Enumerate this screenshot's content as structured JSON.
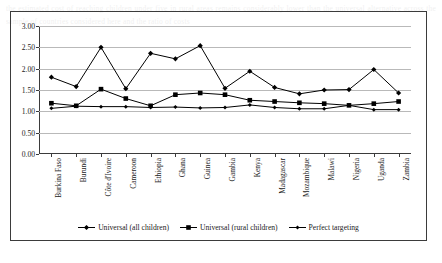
{
  "chart_data": {
    "type": "line",
    "title": "",
    "xlabel": "",
    "ylabel": "",
    "ylim": [
      0,
      3
    ],
    "ytick_step": 0.5,
    "grid": true,
    "legend_position": "bottom",
    "categories": [
      "Burkina Faso",
      "Burundi",
      "Côte d'Ivoire",
      "Cameroon",
      "Ethiopia",
      "Ghana",
      "Guinea",
      "Gambia",
      "Kenya",
      "Madagascar",
      "Mozambique",
      "Malawi",
      "Nigeria",
      "Uganda",
      "Zambia"
    ],
    "ytick_labels": [
      "0.00",
      "0.50",
      "1.00",
      "1.50",
      "2.00",
      "2.50",
      "3.00"
    ],
    "ytick_values": [
      0,
      0.5,
      1.0,
      1.5,
      2.0,
      2.5,
      3.0
    ],
    "series": [
      {
        "name": "Universal (all children)",
        "marker": "diamond",
        "color": "#000000",
        "values": [
          1.8,
          1.58,
          2.5,
          1.53,
          2.36,
          2.23,
          2.54,
          1.54,
          1.94,
          1.56,
          1.41,
          1.5,
          1.51,
          1.98,
          1.43
        ]
      },
      {
        "name": "Universal (rural children)",
        "marker": "square",
        "color": "#000000",
        "values": [
          1.19,
          1.13,
          1.52,
          1.3,
          1.13,
          1.39,
          1.43,
          1.39,
          1.26,
          1.23,
          1.2,
          1.18,
          1.14,
          1.18,
          1.23
        ]
      },
      {
        "name": "Perfect targeting",
        "marker": "diamond-small",
        "color": "#000000",
        "values": [
          1.07,
          1.12,
          1.11,
          1.11,
          1.09,
          1.1,
          1.08,
          1.09,
          1.15,
          1.09,
          1.06,
          1.06,
          1.14,
          1.04,
          1.04
        ]
      }
    ]
  },
  "bleed_text": "the estimated cost of reaching children under five in rural areas remains considerably lower than the universal alternative across the sample of countries considered here and the ratio of costs"
}
